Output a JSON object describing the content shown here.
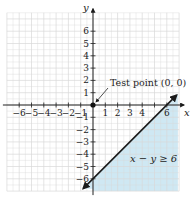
{
  "chart_data": {
    "type": "area",
    "title": "",
    "xlabel": "x",
    "ylabel": "y",
    "xlim": [
      -7,
      7
    ],
    "ylim": [
      -7,
      7.5
    ],
    "grid": true,
    "x_ticks": [
      -6,
      -5,
      -4,
      -3,
      -2,
      -1,
      1,
      2,
      3,
      4,
      6
    ],
    "y_ticks": [
      6,
      5,
      4,
      3,
      2,
      1,
      -1,
      -2,
      -3,
      -4,
      -5,
      -6
    ],
    "x_tick_labels": [
      "-6",
      "-5",
      "-4",
      "-3",
      "-2",
      "-1",
      "1",
      "2",
      "3",
      "4",
      "6"
    ],
    "y_tick_labels": [
      "6",
      "5",
      "4",
      "3",
      "2",
      "1",
      "-1",
      "-2",
      "-3",
      "-4",
      "-5",
      "-6"
    ],
    "boundary_line": {
      "equation": "x - y = 6",
      "style": "solid",
      "points": [
        [
          -0.8,
          -6.8
        ],
        [
          6.8,
          0.8
        ]
      ],
      "arrows": "both"
    },
    "shaded_region": {
      "inequality": "x − y ≥ 6",
      "side": "below-right",
      "color": "#cfe8f3"
    },
    "test_point": {
      "x": 0,
      "y": 0,
      "label": "Test point (0, 0)"
    },
    "annotations": [
      "Test point (0, 0)",
      "x − y ≥ 6"
    ]
  },
  "labels": {
    "x_axis": "x",
    "y_axis": "y",
    "test_point": "Test point (0, 0)",
    "inequality": "x − y ≥ 6"
  },
  "colors": {
    "shade": "#cfe8f3",
    "grid": "#d9d9d9",
    "axis": "#222222",
    "line": "#1a1a1a"
  }
}
